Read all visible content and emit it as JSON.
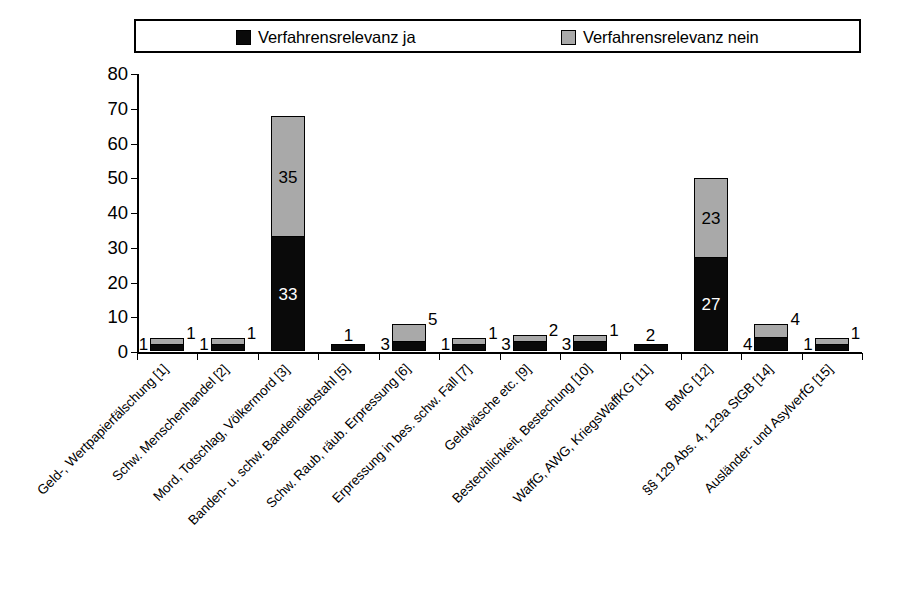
{
  "chart_data": {
    "type": "bar",
    "stacked": true,
    "title": "",
    "subtitle": "",
    "xlabel": "",
    "ylabel": "",
    "ylim": [
      0,
      80
    ],
    "yticks": [
      0,
      10,
      20,
      30,
      40,
      50,
      60,
      70,
      80
    ],
    "grid": false,
    "legend_position": "top",
    "categories": [
      "Geld-, Wertpapierfälschung [1]",
      "Schw. Menschenhandel [2]",
      "Mord, Totschlag, Völkermord [3]",
      "Banden- u. schw. Bandendiebstahl [5]",
      "Schw. Raub, räub. Erpressung [6]",
      "Erpressung in bes. schw. Fall [7]",
      "Geldwäsche etc. [9]",
      "Bestechlichkeit, Bestechung [10]",
      "WaffG, AWG, KriegsWaffKG [11]",
      "BtMG [12]",
      "§§ 129 Abs. 4, 129a StGB [14]",
      "Ausländer- und AsylverfG [15]"
    ],
    "series": [
      {
        "name": "Verfahrensrelevanz ja",
        "color": "#0a0a0a",
        "values": [
          1,
          1,
          33,
          1,
          3,
          1,
          3,
          3,
          2,
          27,
          4,
          1
        ]
      },
      {
        "name": "Verfahrensrelevanz nein",
        "color": "#a9a9a9",
        "values": [
          1,
          1,
          35,
          0,
          5,
          1,
          2,
          1,
          0,
          23,
          4,
          1
        ]
      }
    ],
    "totals": [
      2,
      2,
      68,
      1,
      8,
      2,
      5,
      4,
      2,
      50,
      8,
      2
    ]
  },
  "legend": {
    "entries": [
      {
        "label": "Verfahrensrelevanz ja",
        "color": "#0a0a0a"
      },
      {
        "label": "Verfahrensrelevanz nein",
        "color": "#a9a9a9"
      }
    ]
  },
  "axis": {
    "y_tick_labels": [
      "80",
      "70",
      "60",
      "50",
      "40",
      "30",
      "20",
      "10",
      "0"
    ]
  },
  "bar_value_labels": [
    {
      "ja": "1",
      "nein": "1"
    },
    {
      "ja": "1",
      "nein": "1"
    },
    {
      "ja": "33",
      "nein": "35"
    },
    {
      "ja": "1",
      "nein": ""
    },
    {
      "ja": "3",
      "nein": "5"
    },
    {
      "ja": "1",
      "nein": "1"
    },
    {
      "ja": "3",
      "nein": "2"
    },
    {
      "ja": "3",
      "nein": "1"
    },
    {
      "ja": "2",
      "nein": ""
    },
    {
      "ja": "27",
      "nein": "23"
    },
    {
      "ja": "4",
      "nein": "4"
    },
    {
      "ja": "1",
      "nein": "1"
    }
  ]
}
